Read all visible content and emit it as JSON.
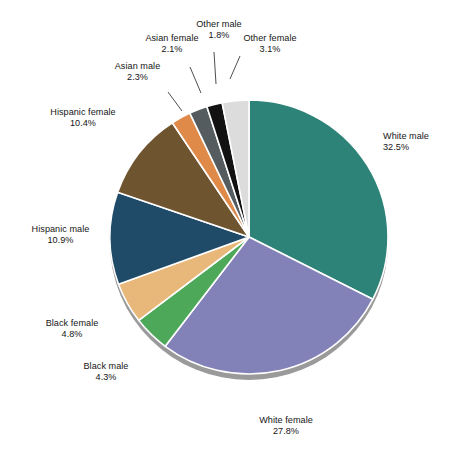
{
  "chart_data": {
    "type": "pie",
    "title": "",
    "subtitle": "",
    "xlabel": "",
    "ylabel": "",
    "legend_position": "none",
    "grid": false,
    "units": "percent",
    "start_angle_deg": 0,
    "direction": "clockwise",
    "categories": [
      "White male",
      "White female",
      "Black male",
      "Black female",
      "Hispanic male",
      "Hispanic female",
      "Asian male",
      "Asian female",
      "Other male",
      "Other female"
    ],
    "values": [
      32.5,
      27.8,
      4.3,
      4.8,
      10.9,
      10.4,
      2.3,
      2.1,
      1.8,
      3.1
    ],
    "value_labels": [
      "32.5%",
      "27.8%",
      "4.3%",
      "4.8%",
      "10.9%",
      "10.4%",
      "2.3%",
      "2.1%",
      "1.8%",
      "3.1%"
    ],
    "colors": [
      "#2d8377",
      "#8382b8",
      "#4ea85a",
      "#e8b87a",
      "#1f4a68",
      "#6f5430",
      "#e08a4a",
      "#555c60",
      "#121212",
      "#dcdcdc"
    ],
    "slices": [
      {
        "label": "White male",
        "value": 32.5,
        "value_label": "32.5%",
        "color": "#2d8377"
      },
      {
        "label": "White female",
        "value": 27.8,
        "value_label": "27.8%",
        "color": "#8382b8"
      },
      {
        "label": "Black male",
        "value": 4.3,
        "value_label": "4.3%",
        "color": "#4ea85a"
      },
      {
        "label": "Black female",
        "value": 4.8,
        "value_label": "4.8%",
        "color": "#e8b87a"
      },
      {
        "label": "Hispanic male",
        "value": 10.9,
        "value_label": "10.9%",
        "color": "#1f4a68"
      },
      {
        "label": "Hispanic female",
        "value": 10.4,
        "value_label": "10.4%",
        "color": "#6f5430"
      },
      {
        "label": "Asian male",
        "value": 2.3,
        "value_label": "2.3%",
        "color": "#e08a4a"
      },
      {
        "label": "Asian female",
        "value": 2.1,
        "value_label": "2.1%",
        "color": "#555c60"
      },
      {
        "label": "Other male",
        "value": 1.8,
        "value_label": "1.8%",
        "color": "#121212"
      },
      {
        "label": "Other female",
        "value": 3.1,
        "value_label": "3.1%",
        "color": "#dcdcdc"
      }
    ]
  },
  "style": {
    "slice_border_color": "#ffffff",
    "rim_shadow_color": "#9a9a9a",
    "background": "#ffffff",
    "label_text_color": "#151515",
    "leader_line_color": "#3a3a3a"
  },
  "labels": {
    "white_male": {
      "name": "White male",
      "value": "32.5%"
    },
    "white_female": {
      "name": "White female",
      "value": "27.8%"
    },
    "black_male": {
      "name": "Black male",
      "value": "4.3%"
    },
    "black_female": {
      "name": "Black female",
      "value": "4.8%"
    },
    "hispanic_male": {
      "name": "Hispanic male",
      "value": "10.9%"
    },
    "hispanic_female": {
      "name": "Hispanic female",
      "value": "10.4%"
    },
    "asian_male": {
      "name": "Asian male",
      "value": "2.3%"
    },
    "asian_female": {
      "name": "Asian female",
      "value": "2.1%"
    },
    "other_male": {
      "name": "Other male",
      "value": "1.8%"
    },
    "other_female": {
      "name": "Other female",
      "value": "3.1%"
    }
  }
}
